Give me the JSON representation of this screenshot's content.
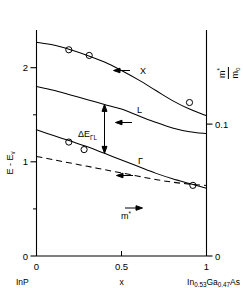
{
  "chart_data": {
    "type": "line",
    "title": "",
    "subtitle": "",
    "xlabel": "x",
    "ylabel": "E - E",
    "ylabel_sub": "v",
    "ylabel_right_num": "m",
    "ylabel_right_num_sup": "*",
    "ylabel_right_den": "m",
    "ylabel_right_den_sub": "o",
    "xlim": [
      0,
      1
    ],
    "ylim": [
      0,
      2.4
    ],
    "ylim_right": [
      0,
      0.1714
    ],
    "grid": false,
    "legend": "inline-curve-labels",
    "x_ticks": [
      0,
      0.5,
      1
    ],
    "x_tick_labels": [
      "0",
      "0.5",
      "1"
    ],
    "x_minor_ticks": [
      0.5
    ],
    "y_ticks_left": [
      0,
      1,
      2
    ],
    "y_tick_labels_left": [
      "0",
      "1",
      "2"
    ],
    "y_minor_ticks_left": [
      0.5,
      1.5
    ],
    "y_ticks_right": [
      0,
      0.1
    ],
    "y_tick_labels_right": [
      "0",
      "0.1"
    ],
    "endpoint_left_label": "InP",
    "endpoint_right_label_parts": {
      "a": "In",
      "a_sub": "0.53",
      "b": "Ga",
      "b_sub": "0.47",
      "c": "As"
    },
    "series": [
      {
        "name": "X",
        "label": "X",
        "style": "solid",
        "axis": "left",
        "arrow_direction": "left",
        "x": [
          0.0,
          0.1,
          0.2,
          0.3,
          0.4,
          0.5,
          0.6,
          0.7,
          0.8,
          0.9,
          1.0
        ],
        "values": [
          2.27,
          2.24,
          2.19,
          2.13,
          2.06,
          1.97,
          1.87,
          1.76,
          1.65,
          1.56,
          1.49
        ],
        "points_x": [
          0.19,
          0.31,
          0.9
        ],
        "points_y": [
          2.19,
          2.13,
          1.63
        ]
      },
      {
        "name": "L",
        "label": "L",
        "style": "solid",
        "axis": "left",
        "arrow_direction": "left",
        "x": [
          0.0,
          0.1,
          0.2,
          0.3,
          0.4,
          0.5,
          0.6,
          0.7,
          0.8,
          0.9,
          1.0
        ],
        "values": [
          1.8,
          1.76,
          1.71,
          1.66,
          1.61,
          1.56,
          1.49,
          1.42,
          1.36,
          1.32,
          1.3
        ],
        "points_x": [],
        "points_y": []
      },
      {
        "name": "Gamma",
        "label": "Γ",
        "style": "solid",
        "axis": "left",
        "arrow_direction": "left",
        "x": [
          0.0,
          0.1,
          0.2,
          0.3,
          0.4,
          0.5,
          0.6,
          0.7,
          0.8,
          0.9,
          1.0
        ],
        "values": [
          1.34,
          1.28,
          1.22,
          1.16,
          1.09,
          1.02,
          0.95,
          0.88,
          0.82,
          0.77,
          0.72
        ],
        "points_x": [
          0.19,
          0.28,
          0.92
        ],
        "points_y": [
          1.21,
          1.13,
          0.75
        ]
      },
      {
        "name": "m*",
        "label": "m",
        "label_sup": "*",
        "style": "dashed",
        "axis": "right",
        "arrow_direction": "right",
        "x": [
          0.0,
          0.1,
          0.2,
          0.3,
          0.4,
          0.5,
          0.6,
          0.7,
          0.8,
          0.9,
          1.0
        ],
        "values": [
          0.0755,
          0.073,
          0.0705,
          0.068,
          0.0655,
          0.063,
          0.0605,
          0.058,
          0.056,
          0.0545,
          0.0535
        ],
        "points_x": [],
        "points_y": []
      }
    ],
    "annotations": [
      {
        "name": "delta-E-Gamma-L",
        "text": "ΔE",
        "sub": "ΓL",
        "type": "double-arrow",
        "x": 0.4,
        "y_top": 1.61,
        "y_bottom": 1.09
      }
    ]
  }
}
